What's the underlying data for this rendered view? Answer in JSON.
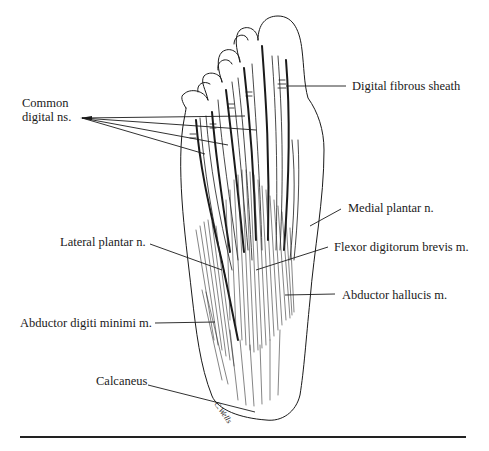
{
  "figure": {
    "labels": [
      {
        "id": "common-digital-nerves",
        "lines": [
          "Common",
          "digital ns."
        ]
      },
      {
        "id": "digital-fibrous-sheath",
        "text": "Digital fibrous sheath"
      },
      {
        "id": "medial-plantar-nerve",
        "text": "Medial plantar n."
      },
      {
        "id": "lateral-plantar-nerve",
        "text": "Lateral plantar n."
      },
      {
        "id": "flexor-digitorum-brevis",
        "text": "Flexor digitorum brevis m."
      },
      {
        "id": "abductor-hallucis",
        "text": "Abductor hallucis m."
      },
      {
        "id": "abductor-digiti-minimi",
        "text": "Abductor digiti minimi m."
      },
      {
        "id": "calcaneus",
        "text": "Calcaneus"
      }
    ],
    "signature": "C.Wells",
    "colors": {
      "ink": "#1a1a1a",
      "background": "#ffffff"
    }
  }
}
